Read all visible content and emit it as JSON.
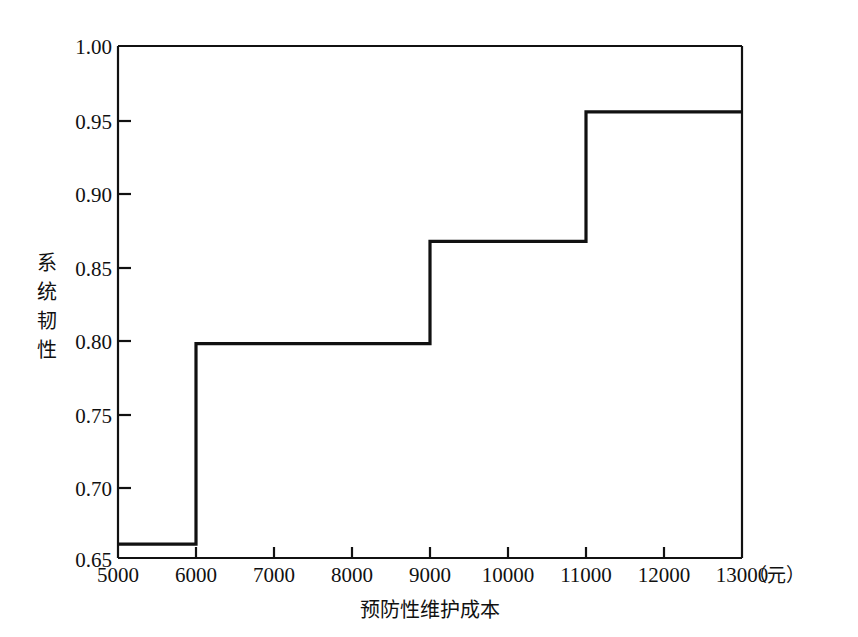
{
  "chart_data": {
    "type": "line",
    "subtype": "step-post",
    "title": "",
    "xlabel": "预防性维护成本",
    "xunit": "（元）",
    "ylabel": "系统韧性",
    "xlim": [
      5000,
      13000
    ],
    "ylim": [
      0.65,
      1.0
    ],
    "xticks": [
      5000,
      6000,
      7000,
      8000,
      9000,
      10000,
      11000,
      12000,
      13000
    ],
    "xtick_labels": [
      "5000",
      "6000",
      "7000",
      "8000",
      "9000",
      "10000",
      "11000",
      "12000",
      "13000"
    ],
    "yticks": [
      0.65,
      0.7,
      0.75,
      0.8,
      0.85,
      0.9,
      0.95,
      1.0
    ],
    "ytick_labels": [
      "0.65",
      "0.70",
      "0.75",
      "0.80",
      "0.85",
      "0.90",
      "0.95",
      "1.00"
    ],
    "grid": false,
    "legend": "none",
    "line_color": "#111111",
    "x": [
      5000,
      6000,
      9000,
      11000,
      13000
    ],
    "values": [
      0.6595,
      0.7965,
      0.8665,
      0.955,
      0.955
    ],
    "steps": [
      {
        "x_start": 5000,
        "x_end": 6000,
        "y": 0.6595
      },
      {
        "x_start": 6000,
        "x_end": 9000,
        "y": 0.7965
      },
      {
        "x_start": 9000,
        "x_end": 11000,
        "y": 0.8665
      },
      {
        "x_start": 11000,
        "x_end": 13000,
        "y": 0.955
      }
    ]
  },
  "ylabel_chars": [
    "系",
    "统",
    "韧",
    "性"
  ]
}
